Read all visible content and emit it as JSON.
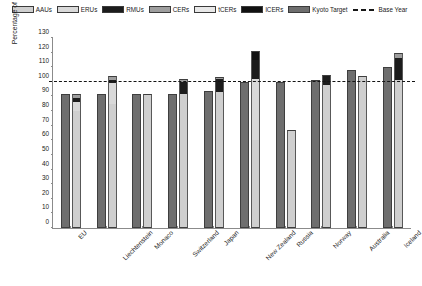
{
  "legend": {
    "items": [
      {
        "label": "AAUs",
        "key": "AAUs",
        "swatch": "hatched-light-gray"
      },
      {
        "label": "ERUs",
        "key": "ERUs",
        "swatch": "light-gray"
      },
      {
        "label": "RMUs",
        "key": "RMUs",
        "swatch": "black"
      },
      {
        "label": "CERs",
        "key": "CERs",
        "swatch": "medium-gray"
      },
      {
        "label": "tCERs",
        "key": "tCERs",
        "swatch": "very-light-gray"
      },
      {
        "label": "lCERs",
        "key": "lCERs",
        "swatch": "black"
      },
      {
        "label": "Kyoto Target",
        "key": "Kyoto",
        "swatch": "dark-gray"
      }
    ],
    "base_year": {
      "label": "Base Year",
      "style": "dashed-line",
      "color": "#141414"
    }
  },
  "chart_data": {
    "type": "bar",
    "title": "",
    "xlabel": "",
    "ylabel": "Percentage of base year emissions (%)",
    "ylim": [
      0,
      130
    ],
    "yticks": [
      0,
      10,
      20,
      30,
      40,
      50,
      60,
      70,
      80,
      90,
      100,
      110,
      120,
      130
    ],
    "grid": false,
    "legend_position": "top",
    "baseline": {
      "value": 100,
      "label": "Base Year"
    },
    "categories": [
      "EU",
      "Liechtenstein",
      "Monaco",
      "Switzerland",
      "Japan",
      "New Zealand",
      "Russia",
      "Norway",
      "Australia",
      "Iceland"
    ],
    "series": [
      {
        "name": "Kyoto Target",
        "key": "Kyoto",
        "values": [
          92,
          92,
          92,
          92,
          94,
          100,
          100,
          101,
          108,
          110
        ]
      },
      {
        "name": "AAUs",
        "key": "AAUs",
        "values": [
          80,
          85,
          92,
          92,
          93,
          60,
          67,
          98,
          104,
          101
        ]
      },
      {
        "name": "ERUs",
        "key": "ERUs",
        "values": [
          6,
          14,
          0,
          0,
          0,
          42,
          0,
          0,
          0,
          0
        ]
      },
      {
        "name": "RMUs",
        "key": "RMUs",
        "values": [
          3,
          2,
          0,
          8,
          9,
          13,
          0,
          6,
          0,
          15
        ]
      },
      {
        "name": "CERs",
        "key": "CERs",
        "values": [
          3,
          3,
          0,
          2,
          1,
          0,
          0,
          1,
          0,
          4
        ]
      },
      {
        "name": "tCERs",
        "key": "tCERs",
        "values": [
          0,
          0,
          0,
          0,
          0,
          0,
          0,
          0,
          0,
          0
        ]
      },
      {
        "name": "lCERs",
        "key": "lCERs",
        "values": [
          0,
          0,
          0,
          0,
          0,
          6,
          0,
          0,
          0,
          0
        ]
      }
    ],
    "stacked_totals": [
      92,
      104,
      92,
      102,
      103,
      121,
      67,
      105,
      104,
      120
    ]
  },
  "colors": {
    "AAUs": "#cfcfcf",
    "ERUs": "#d9d9d9",
    "RMUs": "#1c1c1c",
    "CERs": "#9e9e9e",
    "tCERs": "#e8e8e8",
    "lCERs": "#111111",
    "Kyoto": "#6e6e6e",
    "baseline": "#141414",
    "axis": "#8b8b8b",
    "background": "#ffffff"
  }
}
